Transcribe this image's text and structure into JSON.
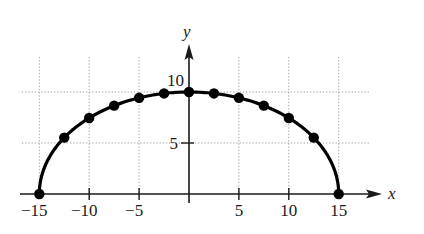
{
  "chart_data": {
    "type": "scatter",
    "subtype": "line-with-markers",
    "title": "",
    "xlabel": "x",
    "ylabel": "y",
    "xlim": [
      -17,
      20
    ],
    "ylim": [
      0,
      14
    ],
    "grid": true,
    "legend": null,
    "x_ticks": [
      -15,
      -10,
      -5,
      5,
      10,
      15
    ],
    "x_tick_labels": [
      "−15",
      "−10",
      "−5",
      "5",
      "10",
      "15"
    ],
    "y_ticks": [
      5,
      10
    ],
    "y_tick_labels": [
      "5",
      "10"
    ],
    "series": [
      {
        "name": "semi-ellipse",
        "description": "Upper half of ellipse x^2/225 + y^2/100 = 1",
        "x": [
          -15,
          -12.5,
          -10,
          -7.5,
          -5,
          -2.5,
          0,
          2.5,
          5,
          7.5,
          10,
          12.5,
          15
        ],
        "y": [
          0,
          5.53,
          7.45,
          8.66,
          9.43,
          9.86,
          10,
          9.86,
          9.43,
          8.66,
          7.45,
          5.53,
          0
        ]
      }
    ]
  },
  "labels": {
    "x_axis": "x",
    "y_axis": "y",
    "x_ticks": [
      "−15",
      "−10",
      "−5",
      "5",
      "10",
      "15"
    ],
    "y_ticks": [
      "5",
      "10"
    ]
  }
}
